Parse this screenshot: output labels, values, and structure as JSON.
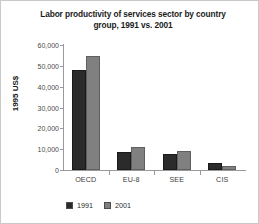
{
  "chart_data": {
    "type": "bar",
    "title": "Labor productivity of services sector by country group, 1991 vs. 2001",
    "title_line1": "Labor productivity of services sector by country",
    "title_line2": "group, 1991 vs. 2001",
    "xlabel": "",
    "ylabel": "1995 US$",
    "categories": [
      "OECD",
      "EU-8",
      "SEE",
      "CIS"
    ],
    "series": [
      {
        "name": "1991",
        "color": "#2b2b2b",
        "values": [
          48000,
          8800,
          7800,
          3200
        ]
      },
      {
        "name": "2001",
        "color": "#808080",
        "values": [
          54500,
          11200,
          9100,
          1900
        ]
      }
    ],
    "ylim": [
      0,
      60000
    ],
    "ytick_values": [
      60000,
      50000,
      40000,
      30000,
      20000,
      10000,
      0
    ],
    "ytick_labels": [
      "60,000",
      "50,000",
      "40,000",
      "30,000",
      "20,000",
      "10,000",
      "0"
    ],
    "grid": false,
    "legend_position": "bottom-left",
    "legend": [
      "1991",
      "2001"
    ]
  }
}
